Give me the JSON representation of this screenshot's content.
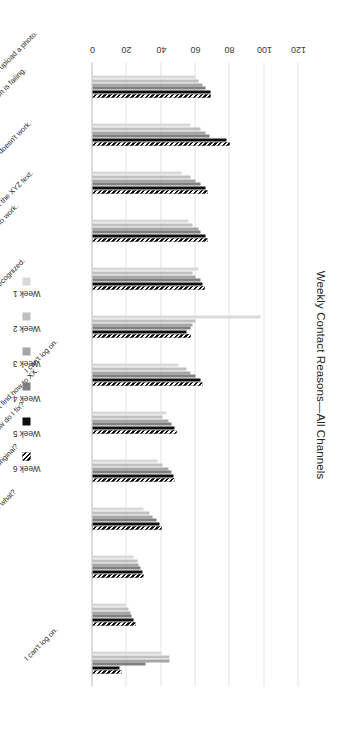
{
  "chart_data": {
    "type": "bar",
    "orientation": "horizontal",
    "title": "Weekly Contact Reasons—All Channels",
    "xlabel": "",
    "ylabel": "",
    "ylim": [
      0,
      120
    ],
    "ticks": [
      "0",
      "20",
      "40",
      "60",
      "80",
      "100",
      "120"
    ],
    "grid": true,
    "legend_position": "bottom",
    "categories": [
      "I can't upload a photo.",
      "Facial recognition is failing.",
      "My XYZ ID doesn't work.",
      "I didn't get the XYZ text.",
      "I can't get my renewal to work.",
      "My license isn't recognized.",
      "I can't log on.",
      "I can't find how to XX.",
      "I missed XYZ. How do I fix?",
      "Why do you need my original?",
      "I haven't got an XX. Now what?",
      "It's been over XYZ months, so I can't…",
      "I can't log on."
    ],
    "series": [
      {
        "name": "Week 1",
        "color": "#d9d9d9",
        "hatched": false,
        "values": [
          60,
          57,
          52,
          56,
          62,
          98,
          50,
          43,
          38,
          30,
          24,
          19,
          40
        ]
      },
      {
        "name": "Week 2",
        "color": "#bfbfbf",
        "hatched": false,
        "values": [
          62,
          63,
          57,
          58,
          58,
          60,
          55,
          41,
          41,
          33,
          26,
          21,
          45
        ]
      },
      {
        "name": "Week 3",
        "color": "#a6a6a6",
        "hatched": false,
        "values": [
          64,
          66,
          60,
          62,
          60,
          58,
          57,
          44,
          44,
          35,
          27,
          22,
          45
        ]
      },
      {
        "name": "Week 4",
        "color": "#7f7f7f",
        "hatched": false,
        "values": [
          66,
          68,
          63,
          63,
          63,
          57,
          60,
          46,
          46,
          37,
          28,
          23,
          31
        ]
      },
      {
        "name": "Week 5",
        "color": "#0d0d0d",
        "hatched": false,
        "values": [
          69,
          78,
          66,
          66,
          64,
          55,
          63,
          48,
          47,
          39,
          29,
          24,
          16
        ]
      },
      {
        "name": "Week 6",
        "color": "#0d0d0d",
        "hatched": true,
        "values": [
          69,
          80,
          67,
          67,
          65,
          57,
          64,
          49,
          48,
          40,
          30,
          25,
          17
        ]
      }
    ]
  }
}
